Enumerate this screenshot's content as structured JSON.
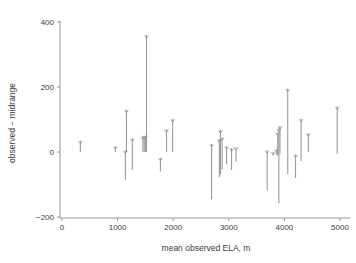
{
  "chart_data": {
    "type": "scatter",
    "title": "",
    "xlabel": "mean observed ELA, m",
    "ylabel": "observed − midrange",
    "xlim": [
      -250,
      5300
    ],
    "ylim": [
      -240,
      430
    ],
    "xticks": [
      0,
      1000,
      2000,
      3000,
      4000,
      5000
    ],
    "xtick_labels": [
      "0",
      "1000",
      "2000",
      "3000",
      "4000",
      "5000"
    ],
    "yticks": [
      -200,
      0,
      200,
      400
    ],
    "ytick_labels": [
      "−200",
      "0",
      "200",
      "400"
    ],
    "grid": false,
    "legend": null,
    "marker": "downward-caret-at-top-of-segment",
    "series_color": "#9a9a9a",
    "segments": [
      {
        "x": 330,
        "low": 0,
        "high": 35
      },
      {
        "x": 960,
        "low": 0,
        "high": 18
      },
      {
        "x": 1140,
        "low": -85,
        "high": 5
      },
      {
        "x": 1160,
        "low": 0,
        "high": 130
      },
      {
        "x": 1265,
        "low": -55,
        "high": 42
      },
      {
        "x": 1455,
        "low": 0,
        "high": 48
      },
      {
        "x": 1478,
        "low": 0,
        "high": 50
      },
      {
        "x": 1500,
        "low": 0,
        "high": 50
      },
      {
        "x": 1520,
        "low": 0,
        "high": 360
      },
      {
        "x": 1770,
        "low": -60,
        "high": -18
      },
      {
        "x": 1880,
        "low": 0,
        "high": 70
      },
      {
        "x": 1990,
        "low": 0,
        "high": 102
      },
      {
        "x": 2690,
        "low": -145,
        "high": 25
      },
      {
        "x": 2830,
        "low": -78,
        "high": 40
      },
      {
        "x": 2850,
        "low": -70,
        "high": 68
      },
      {
        "x": 2880,
        "low": -55,
        "high": 45
      },
      {
        "x": 2960,
        "low": -38,
        "high": 18
      },
      {
        "x": 3050,
        "low": -55,
        "high": 12
      },
      {
        "x": 3130,
        "low": -30,
        "high": 15
      },
      {
        "x": 3690,
        "low": -118,
        "high": 5
      },
      {
        "x": 3800,
        "low": -10,
        "high": 0
      },
      {
        "x": 3860,
        "low": -8,
        "high": 8
      },
      {
        "x": 3880,
        "low": -12,
        "high": 60
      },
      {
        "x": 3900,
        "low": -158,
        "high": 72
      },
      {
        "x": 3920,
        "low": -5,
        "high": 80
      },
      {
        "x": 4060,
        "low": -68,
        "high": 195
      },
      {
        "x": 4200,
        "low": -80,
        "high": -8
      },
      {
        "x": 4300,
        "low": -28,
        "high": 102
      },
      {
        "x": 4430,
        "low": 0,
        "high": 58
      },
      {
        "x": 4950,
        "low": -5,
        "high": 140
      }
    ]
  }
}
